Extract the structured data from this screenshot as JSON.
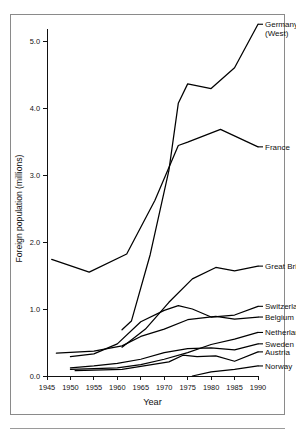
{
  "figure": {
    "border_color": "#8a8a8a",
    "background": "#ffffff",
    "line_color": "#000000"
  },
  "chart_data": {
    "type": "line",
    "title": "",
    "xlabel": "Year",
    "ylabel": "Foreign population (millions)",
    "xlim": [
      1945,
      1990
    ],
    "ylim": [
      0.0,
      5.0
    ],
    "xticks": [
      1945,
      1950,
      1955,
      1960,
      1965,
      1970,
      1975,
      1980,
      1985,
      1990
    ],
    "xtick_labels": [
      "1945",
      "1950",
      "1955",
      "1960",
      "1965",
      "1970",
      "1975",
      "1980",
      "1985",
      "1990"
    ],
    "yticks": [
      0.0,
      1.0,
      2.0,
      3.0,
      4.0,
      5.0
    ],
    "ytick_labels": [
      "0.0",
      "1.0",
      "2.0",
      "3.0",
      "4.0",
      "5.0"
    ],
    "grid": false,
    "legend_position": "right-of-line-ends",
    "series": [
      {
        "name": "Germany (West)",
        "label": "Germany",
        "label_line2": "(West)",
        "label_x": 1991.5,
        "label_y": 5.25,
        "x": [
          1961,
          1963,
          1967,
          1971,
          1973,
          1975,
          1980,
          1985,
          1990
        ],
        "y": [
          0.69,
          0.82,
          1.81,
          3.07,
          4.07,
          4.36,
          4.29,
          4.6,
          5.25
        ]
      },
      {
        "name": "France",
        "label": "France",
        "label_x": 1991.5,
        "label_y": 3.42,
        "x": [
          1946,
          1954,
          1962,
          1968,
          1973,
          1975,
          1982,
          1990
        ],
        "y": [
          1.74,
          1.55,
          1.82,
          2.62,
          3.44,
          3.49,
          3.68,
          3.42
        ]
      },
      {
        "name": "Great Britain",
        "label": "Great Britain",
        "label_x": 1991.5,
        "label_y": 1.64,
        "x": [
          1961,
          1966,
          1971,
          1976,
          1981,
          1985,
          1990
        ],
        "y": [
          0.43,
          0.7,
          1.1,
          1.45,
          1.62,
          1.57,
          1.64
        ]
      },
      {
        "name": "Switzerland",
        "label": "Switzerland",
        "label_x": 1991.5,
        "label_y": 1.04,
        "x": [
          1950,
          1955,
          1960,
          1965,
          1970,
          1973,
          1976,
          1980,
          1985,
          1990
        ],
        "y": [
          0.29,
          0.33,
          0.48,
          0.81,
          0.98,
          1.05,
          1.0,
          0.88,
          0.91,
          1.04
        ]
      },
      {
        "name": "Belgium",
        "label": "Belgium",
        "label_x": 1991.5,
        "label_y": 0.88,
        "x": [
          1947,
          1955,
          1961,
          1965,
          1970,
          1975,
          1981,
          1985,
          1990
        ],
        "y": [
          0.34,
          0.37,
          0.45,
          0.59,
          0.7,
          0.84,
          0.89,
          0.85,
          0.88
        ]
      },
      {
        "name": "Netherlands",
        "label": "Netherlands",
        "label_x": 1991.5,
        "label_y": 0.65,
        "x": [
          1950,
          1960,
          1965,
          1970,
          1975,
          1980,
          1985,
          1990
        ],
        "y": [
          0.1,
          0.12,
          0.17,
          0.25,
          0.35,
          0.47,
          0.55,
          0.65
        ]
      },
      {
        "name": "Sweden",
        "label": "Sweden",
        "label_x": 1991.5,
        "label_y": 0.48,
        "x": [
          1950,
          1955,
          1960,
          1965,
          1970,
          1975,
          1980,
          1985,
          1990
        ],
        "y": [
          0.12,
          0.15,
          0.19,
          0.25,
          0.35,
          0.41,
          0.42,
          0.39,
          0.48
        ]
      },
      {
        "name": "Austria",
        "label": "Austria",
        "label_x": 1991.5,
        "label_y": 0.36,
        "x": [
          1951,
          1961,
          1971,
          1974,
          1977,
          1981,
          1985,
          1990
        ],
        "y": [
          0.08,
          0.1,
          0.21,
          0.31,
          0.29,
          0.3,
          0.22,
          0.36
        ]
      },
      {
        "name": "Norway",
        "label": "Norway",
        "label_x": 1991.5,
        "label_y": 0.15,
        "x": [
          1976,
          1980,
          1985,
          1990
        ],
        "y": [
          0.0,
          0.06,
          0.1,
          0.15
        ]
      }
    ]
  }
}
